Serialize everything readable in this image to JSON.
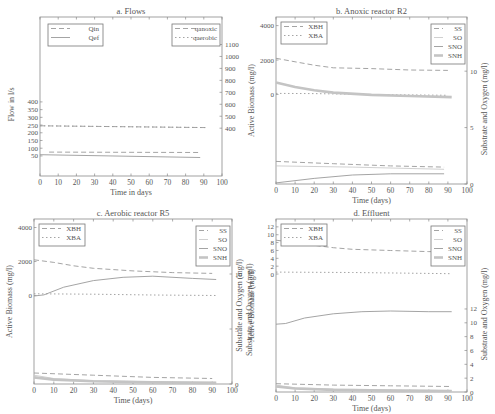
{
  "chart_data": [
    {
      "id": "a",
      "type": "line",
      "title": "a. Flows",
      "xlabel": "Time in days",
      "ylabel": "Flow in l/s",
      "ylabel_right": "",
      "xlim": [
        0,
        100
      ],
      "xticks": [
        0,
        10,
        20,
        30,
        40,
        50,
        60,
        70,
        80,
        90,
        100
      ],
      "yticks_left": [
        50,
        100,
        150,
        200,
        250,
        300,
        350,
        400
      ],
      "yticks_right": [
        400,
        500,
        600,
        700,
        800,
        900,
        1000,
        1100
      ],
      "legend_left": [
        "Qin",
        "Qef"
      ],
      "legend_right": [
        "qanoxic",
        "qaerobic"
      ],
      "series": [
        {
          "name": "Qin",
          "style": "dashed",
          "x": [
            5,
            88
          ],
          "y": [
            75,
            72
          ]
        },
        {
          "name": "Qef",
          "style": "solid",
          "x": [
            0,
            88
          ],
          "y": [
            58,
            40
          ]
        },
        {
          "name": "qanoxic",
          "style": "dashed",
          "axis": "right",
          "x": [
            0,
            92
          ],
          "y": [
            420,
            405
          ]
        },
        {
          "name": "qaerobic",
          "style": "dotted",
          "axis": "right",
          "x": [
            0,
            92
          ],
          "y": [
            420,
            405
          ]
        }
      ]
    },
    {
      "id": "b",
      "type": "line",
      "title": "b. Anoxic reactor R2",
      "xlabel": "Time (days)",
      "ylabel": "Active Biomass (mg/l)",
      "ylabel_right": "Substrate and Oxygen (mg/l)",
      "xlim": [
        0,
        100
      ],
      "xticks": [
        0,
        10,
        20,
        30,
        40,
        50,
        60,
        70,
        80,
        90,
        100
      ],
      "yticks_left": [
        0,
        2000,
        4000
      ],
      "yticks_right": [
        0,
        5,
        10
      ],
      "legend_left": [
        "XBH",
        "XBA"
      ],
      "legend_right": [
        "SS",
        "SO",
        "SNO",
        "SNH"
      ],
      "series": [
        {
          "name": "XBH",
          "style": "dashed",
          "x": [
            0,
            10,
            20,
            30,
            50,
            70,
            90
          ],
          "y": [
            2100,
            1900,
            1700,
            1550,
            1500,
            1420,
            1400
          ]
        },
        {
          "name": "XBA",
          "style": "dotted",
          "x": [
            0,
            20,
            50,
            90
          ],
          "y": [
            60,
            50,
            0,
            -50
          ]
        },
        {
          "name": "SS",
          "style": "dashed",
          "axis": "right",
          "x": [
            0,
            30,
            60,
            88
          ],
          "y": [
            2.0,
            1.8,
            1.6,
            1.5
          ]
        },
        {
          "name": "SO",
          "style": "thin",
          "axis": "right",
          "x": [
            0,
            40,
            88
          ],
          "y": [
            1.6,
            1.5,
            1.3
          ]
        },
        {
          "name": "SNO",
          "style": "solid",
          "axis": "right",
          "x": [
            0,
            20,
            40,
            60,
            88
          ],
          "y": [
            0.1,
            0.5,
            0.8,
            0.9,
            0.9
          ]
        },
        {
          "name": "SNH",
          "style": "thick",
          "axis": "right",
          "x": [
            0,
            10,
            20,
            30,
            50,
            70,
            92
          ],
          "y": [
            9.0,
            8.6,
            8.3,
            8.1,
            7.9,
            7.8,
            7.7
          ]
        }
      ]
    },
    {
      "id": "c",
      "type": "line",
      "title": "c. Aerobic reactor R5",
      "xlabel": "Time (days)",
      "ylabel": "Active Biomass (mg/l)",
      "ylabel_right": "Substrate and Oxygen (mg/l)",
      "xlim": [
        0,
        100
      ],
      "xticks": [
        0,
        10,
        20,
        30,
        40,
        50,
        60,
        70,
        80,
        90,
        100
      ],
      "yticks_left": [
        0,
        2000,
        4000
      ],
      "yticks_right": [
        0,
        5,
        10
      ],
      "legend_left": [
        "XBH",
        "XBA"
      ],
      "legend_right": [
        "SS",
        "SO",
        "SNO",
        "SNH"
      ],
      "series": [
        {
          "name": "XBH",
          "style": "dashed",
          "x": [
            0,
            10,
            20,
            30,
            50,
            70,
            90
          ],
          "y": [
            2100,
            1950,
            1750,
            1600,
            1450,
            1350,
            1300
          ]
        },
        {
          "name": "XBA",
          "style": "dotted",
          "x": [
            0,
            30,
            60,
            92
          ],
          "y": [
            100,
            80,
            30,
            0
          ]
        },
        {
          "name": "SNO",
          "style": "solid",
          "axis": "right",
          "x": [
            0,
            5,
            15,
            30,
            45,
            60,
            80,
            92
          ],
          "y": [
            8.0,
            8.1,
            8.8,
            9.4,
            9.7,
            9.8,
            9.6,
            9.5
          ]
        },
        {
          "name": "SS",
          "style": "dashed",
          "axis": "right",
          "x": [
            0,
            30,
            60,
            90
          ],
          "y": [
            1.0,
            0.8,
            0.6,
            0.5
          ]
        },
        {
          "name": "SO",
          "style": "thin",
          "axis": "right",
          "x": [
            0,
            10,
            30,
            60,
            92
          ],
          "y": [
            0.8,
            0.5,
            0.3,
            0.2,
            0.15
          ]
        },
        {
          "name": "SNH",
          "style": "thick",
          "axis": "right",
          "x": [
            0,
            10,
            30,
            60,
            92
          ],
          "y": [
            0.6,
            0.4,
            0.25,
            0.15,
            0.1
          ]
        }
      ]
    },
    {
      "id": "d",
      "type": "line",
      "title": "d. Effluent",
      "xlabel": "Time (days)",
      "ylabel": "Active Biomass (mg/l)",
      "ylabel_outer": "Substrate and Oxygen (mg/l)",
      "ylabel_right": "Substrate and Oxygen (mg/l)",
      "xlim": [
        0,
        100
      ],
      "xticks": [
        0,
        10,
        20,
        30,
        40,
        50,
        60,
        70,
        80,
        90,
        100
      ],
      "yticks_left": [
        0,
        2,
        4,
        6,
        8,
        10,
        12
      ],
      "yticks_right": [
        0,
        2,
        4,
        6,
        8,
        10,
        12
      ],
      "legend_left": [
        "XBH",
        "XBA"
      ],
      "legend_right": [
        "SS",
        "SO",
        "SNO",
        "SNH"
      ],
      "series": [
        {
          "name": "XBH",
          "style": "dashed",
          "x": [
            0,
            10,
            20,
            30,
            40,
            60,
            80,
            92
          ],
          "y": [
            8.6,
            8.0,
            7.3,
            6.7,
            6.3,
            6.0,
            5.7,
            5.6
          ]
        },
        {
          "name": "XBA",
          "style": "dotted",
          "x": [
            0,
            40,
            92
          ],
          "y": [
            0.5,
            0.4,
            0.1
          ]
        },
        {
          "name": "SNO",
          "style": "solid",
          "axis": "right",
          "x": [
            0,
            5,
            15,
            30,
            45,
            60,
            80,
            92
          ],
          "y": [
            9.8,
            9.9,
            10.7,
            11.3,
            11.6,
            11.7,
            11.6,
            11.6
          ]
        },
        {
          "name": "SS",
          "style": "dashed",
          "axis": "right",
          "x": [
            0,
            30,
            60,
            92
          ],
          "y": [
            1.2,
            1.0,
            0.9,
            0.8
          ]
        },
        {
          "name": "SO",
          "style": "thin",
          "axis": "right",
          "x": [
            0,
            10,
            30,
            60,
            92
          ],
          "y": [
            1.0,
            0.6,
            0.4,
            0.3,
            0.2
          ]
        },
        {
          "name": "SNH",
          "style": "thick",
          "axis": "right",
          "x": [
            0,
            10,
            30,
            60,
            92
          ],
          "y": [
            0.8,
            0.5,
            0.3,
            0.2,
            0.15
          ]
        }
      ]
    }
  ],
  "layout_panels": {
    "a": {
      "x0": 40,
      "y0": 17,
      "x1": 222,
      "y1": 176,
      "left_range": [
        -80,
        950
      ],
      "right_range": [
        0,
        1330
      ]
    },
    "b": {
      "x0": 276,
      "y0": 17,
      "x1": 467,
      "y1": 184,
      "left_range": [
        -5200,
        4500
      ],
      "right_range": [
        0,
        14.8
      ]
    },
    "c": {
      "x0": 34,
      "y0": 219,
      "x1": 232,
      "y1": 384,
      "left_range": [
        -5200,
        4500
      ],
      "right_range": [
        0,
        15
      ]
    },
    "d": {
      "x0": 276,
      "y0": 219,
      "x1": 467,
      "y1": 392,
      "left_range": [
        -30,
        14
      ],
      "right_range": [
        0,
        25
      ]
    }
  },
  "colors": {
    "frame": "#8a8a8a",
    "series_gray": "#9a9a9a",
    "series_light": "#c4c4c4",
    "text": "#555555"
  }
}
